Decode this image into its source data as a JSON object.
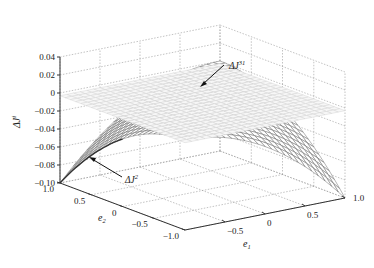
{
  "chart_data": {
    "type": "surface3d",
    "title": "",
    "xlabel": "e1",
    "ylabel": "e2",
    "zlabel": "ΔJ^i",
    "x_ticks": [
      "-0.5",
      "0",
      "0.5",
      "1.0"
    ],
    "x_tick_values": [
      -0.5,
      0,
      0.5,
      1.0
    ],
    "y_ticks": [
      "1.0",
      "0.5",
      "0",
      "-0.5",
      "-1.0"
    ],
    "y_tick_values": [
      1.0,
      0.5,
      0,
      -0.5,
      -1.0
    ],
    "z_ticks": [
      "0.04",
      "0.02",
      "0",
      "-0.02",
      "-0.04",
      "-0.06",
      "-0.08",
      "-0.10"
    ],
    "z_tick_values": [
      0.04,
      0.02,
      0,
      -0.02,
      -0.04,
      -0.06,
      -0.08,
      -0.1
    ],
    "xlim": [
      -1,
      1
    ],
    "ylim": [
      -1,
      1
    ],
    "zlim": [
      -0.1,
      0.04
    ],
    "grid": true,
    "series": [
      {
        "name": "ΔJ^31",
        "description": "nearly flat light-gray mesh surface near zero",
        "formula": "z ≈ -0.003",
        "color": "#cfcfcf",
        "sample_grid": {
          "e1": [
            -1,
            -0.5,
            0,
            0.5,
            1
          ],
          "e2": [
            -1,
            -0.5,
            0,
            0.5,
            1
          ],
          "z": [
            [
              -0.003,
              -0.003,
              -0.003,
              -0.003,
              -0.003
            ],
            [
              -0.003,
              -0.003,
              -0.003,
              -0.003,
              -0.003
            ],
            [
              -0.003,
              -0.003,
              -0.003,
              -0.003,
              -0.003
            ],
            [
              -0.003,
              -0.003,
              -0.003,
              -0.003,
              -0.003
            ],
            [
              -0.003,
              -0.003,
              -0.003,
              -0.003,
              -0.003
            ]
          ]
        }
      },
      {
        "name": "ΔJ^2",
        "description": "dark mesh surface curving down to -0.10 at corners (e1=-1,e2=1) and (e1=1,e2=-1)",
        "formula": "z ≈ -0.1*((e2-e1)/2)^2",
        "color": "#555555",
        "sample_grid": {
          "e1": [
            -1,
            -0.5,
            0,
            0.5,
            1
          ],
          "e2": [
            -1,
            -0.5,
            0,
            0.5,
            1
          ],
          "z": [
            [
              0.0,
              -0.006,
              -0.025,
              -0.056,
              -0.1
            ],
            [
              -0.006,
              0.0,
              -0.006,
              -0.025,
              -0.056
            ],
            [
              -0.025,
              -0.006,
              0.0,
              -0.006,
              -0.025
            ],
            [
              -0.056,
              -0.025,
              -0.006,
              0.0,
              -0.006
            ],
            [
              -0.1,
              -0.056,
              -0.025,
              -0.006,
              0.0
            ]
          ]
        }
      }
    ],
    "annotations": [
      {
        "text": "ΔJ",
        "sup": "31",
        "arrow_to": "flat surface"
      },
      {
        "text": "ΔJ",
        "sup": "2",
        "arrow_to": "curved surface edge"
      }
    ]
  }
}
